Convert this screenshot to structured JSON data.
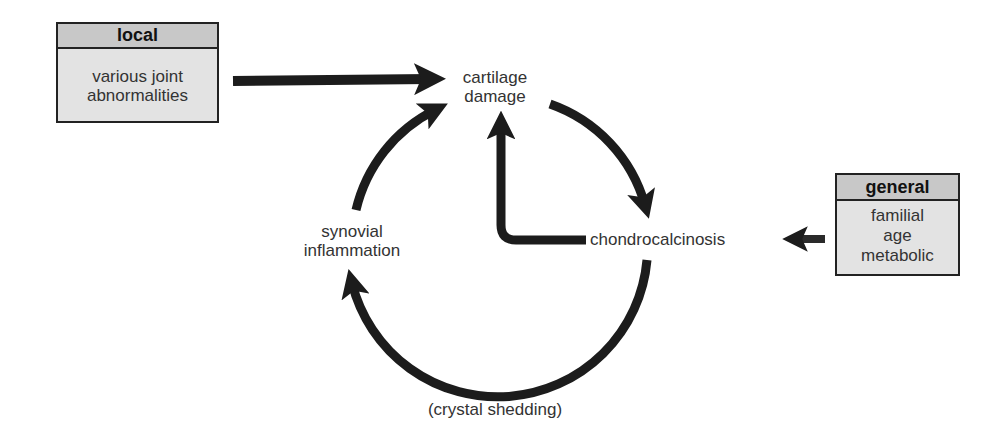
{
  "boxes": {
    "local": {
      "header": "local",
      "lines": [
        "various joint",
        "abnormalities"
      ]
    },
    "general": {
      "header": "general",
      "lines": [
        "familial",
        "age",
        "metabolic"
      ]
    }
  },
  "nodes": {
    "cartilage_damage": [
      "cartilage",
      "damage"
    ],
    "synovial_inflammation": [
      "synovial",
      "inflammation"
    ],
    "chondrocalcinosis": "chondrocalcinosis"
  },
  "labels": {
    "crystal_shedding": "(crystal shedding)"
  },
  "colors": {
    "arrow": "#1c1c1c",
    "box_fill": "#e3e3e3",
    "box_header_fill": "#c8c8c8",
    "text": "#333333"
  },
  "edges": [
    {
      "from": "local",
      "to": "cartilage_damage"
    },
    {
      "from": "cartilage_damage",
      "to": "chondrocalcinosis"
    },
    {
      "from": "chondrocalcinosis",
      "to": "cartilage_damage"
    },
    {
      "from": "chondrocalcinosis",
      "to": "synovial_inflammation",
      "label": "(crystal shedding)"
    },
    {
      "from": "synovial_inflammation",
      "to": "cartilage_damage"
    },
    {
      "from": "general",
      "to": "chondrocalcinosis"
    }
  ]
}
